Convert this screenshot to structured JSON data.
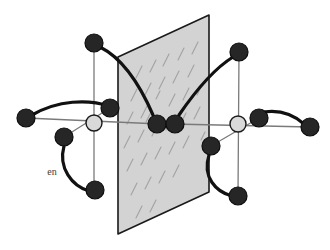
{
  "figure": {
    "background_color": "#ffffff",
    "width": 330,
    "height": 250
  },
  "labels": {
    "en_ligand": "en"
  },
  "colors": {
    "atom_dark": "#262626",
    "atom_dark_stroke": "#0d0d0d",
    "metal_center_fill": "#d9d9d9",
    "metal_center_stroke": "#1a1a1a",
    "mirror_plane_fill": "#d3d3d3",
    "mirror_plane_stroke": "#1a1a1a",
    "bond_dark": "#111111",
    "bond_thin": "#7a7a7a",
    "hatch_mark": "#9a9a9a",
    "label_text": "#3b3b3b"
  },
  "mirror_plane": {
    "name": "mirror-plane",
    "shape": "parallelogram",
    "corners": [
      [
        118,
        57
      ],
      [
        209,
        15
      ],
      [
        209,
        192
      ],
      [
        118,
        234
      ]
    ],
    "hatch_marks": [
      [
        136,
        78,
        142,
        66
      ],
      [
        150,
        72,
        156,
        60
      ],
      [
        163,
        66,
        169,
        54
      ],
      [
        178,
        60,
        184,
        48
      ],
      [
        192,
        54,
        198,
        42
      ],
      [
        131,
        101,
        137,
        89
      ],
      [
        145,
        95,
        151,
        83
      ],
      [
        159,
        89,
        165,
        77
      ],
      [
        173,
        83,
        179,
        71
      ],
      [
        188,
        77,
        194,
        65
      ],
      [
        127,
        124,
        133,
        112
      ],
      [
        141,
        118,
        147,
        106
      ],
      [
        169,
        106,
        175,
        94
      ],
      [
        183,
        100,
        189,
        88
      ],
      [
        197,
        95,
        203,
        83
      ],
      [
        124,
        148,
        130,
        136
      ],
      [
        138,
        142,
        144,
        130
      ],
      [
        152,
        136,
        158,
        124
      ],
      [
        166,
        130,
        172,
        118
      ],
      [
        180,
        125,
        186,
        113
      ],
      [
        194,
        119,
        200,
        107
      ],
      [
        127,
        171,
        133,
        159
      ],
      [
        141,
        165,
        147,
        153
      ],
      [
        155,
        159,
        161,
        147
      ],
      [
        169,
        154,
        175,
        142
      ],
      [
        183,
        148,
        189,
        136
      ],
      [
        131,
        195,
        137,
        183
      ],
      [
        145,
        189,
        151,
        177
      ],
      [
        159,
        183,
        165,
        171
      ],
      [
        173,
        177,
        179,
        165
      ],
      [
        136,
        218,
        142,
        206
      ],
      [
        150,
        212,
        156,
        200
      ],
      [
        156,
        99,
        160,
        91
      ],
      [
        146,
        122,
        150,
        114
      ],
      [
        201,
        140,
        205,
        132
      ]
    ]
  },
  "metal_centers": [
    {
      "name": "metal-center-left",
      "cx": 94,
      "cy": 123,
      "r": 8
    },
    {
      "name": "metal-center-right",
      "cx": 238,
      "cy": 124,
      "r": 8
    }
  ],
  "bridging_atoms": [
    {
      "name": "bridging-atom-left",
      "cx": 157,
      "cy": 124,
      "r": 9
    },
    {
      "name": "bridging-atom-right",
      "cx": 175,
      "cy": 124,
      "r": 9
    }
  ],
  "nitrogen_atoms": [
    {
      "name": "nitrogen-top-left",
      "cx": 94,
      "cy": 43,
      "r": 9
    },
    {
      "name": "nitrogen-far-left",
      "cx": 26,
      "cy": 118,
      "r": 9
    },
    {
      "name": "nitrogen-inner-left",
      "cx": 110,
      "cy": 108,
      "r": 9
    },
    {
      "name": "nitrogen-lower-left-upper",
      "cx": 64,
      "cy": 137,
      "r": 9
    },
    {
      "name": "nitrogen-lower-left-lower",
      "cx": 95,
      "cy": 190,
      "r": 9
    },
    {
      "name": "nitrogen-top-right",
      "cx": 239,
      "cy": 52,
      "r": 9
    },
    {
      "name": "nitrogen-far-right",
      "cx": 310,
      "cy": 127,
      "r": 9
    },
    {
      "name": "nitrogen-inner-right",
      "cx": 259,
      "cy": 118,
      "r": 9
    },
    {
      "name": "nitrogen-lower-right-upper",
      "cx": 211,
      "cy": 146,
      "r": 9
    },
    {
      "name": "nitrogen-lower-right-lower",
      "cx": 238,
      "cy": 196,
      "r": 9
    }
  ],
  "thin_bonds": [
    {
      "name": "thin-bond-left-vertical",
      "x1": 94,
      "y1": 43,
      "x2": 94,
      "y2": 190
    },
    {
      "name": "thin-bond-left-horizontal",
      "x1": 26,
      "y1": 118,
      "x2": 160,
      "y2": 124
    },
    {
      "name": "thin-bond-left-inner-diag",
      "x1": 110,
      "y1": 108,
      "x2": 64,
      "y2": 137
    },
    {
      "name": "thin-bond-right-vertical",
      "x1": 239,
      "y1": 52,
      "x2": 238,
      "y2": 196
    },
    {
      "name": "thin-bond-right-horizontal",
      "x1": 172,
      "y1": 124,
      "x2": 310,
      "y2": 127
    },
    {
      "name": "thin-bond-right-inner-diag",
      "x1": 259,
      "y1": 118,
      "x2": 211,
      "y2": 146
    }
  ],
  "curved_bonds": [
    {
      "name": "curve-top-left-to-bridge",
      "d": "M 100 47 C 122 58 140 85 153 115"
    },
    {
      "name": "curve-far-left-to-inner-left",
      "d": "M 32 115 C 58 100 88 99 109 106"
    },
    {
      "name": "curve-en-chelate-left",
      "d": "M 64 146 C 58 168 72 186 89 191"
    },
    {
      "name": "curve-top-right-to-bridge",
      "d": "M 233 57 C 212 70 192 96 179 115"
    },
    {
      "name": "curve-far-right-to-inner-right",
      "d": "M 304 124 C 288 110 272 110 259 113"
    },
    {
      "name": "curve-en-chelate-right",
      "d": "M 209 155 C 202 177 216 192 232 196"
    }
  ],
  "en_label_positions": [
    {
      "name": "en-label-left",
      "x": 52,
      "y": 175
    }
  ]
}
